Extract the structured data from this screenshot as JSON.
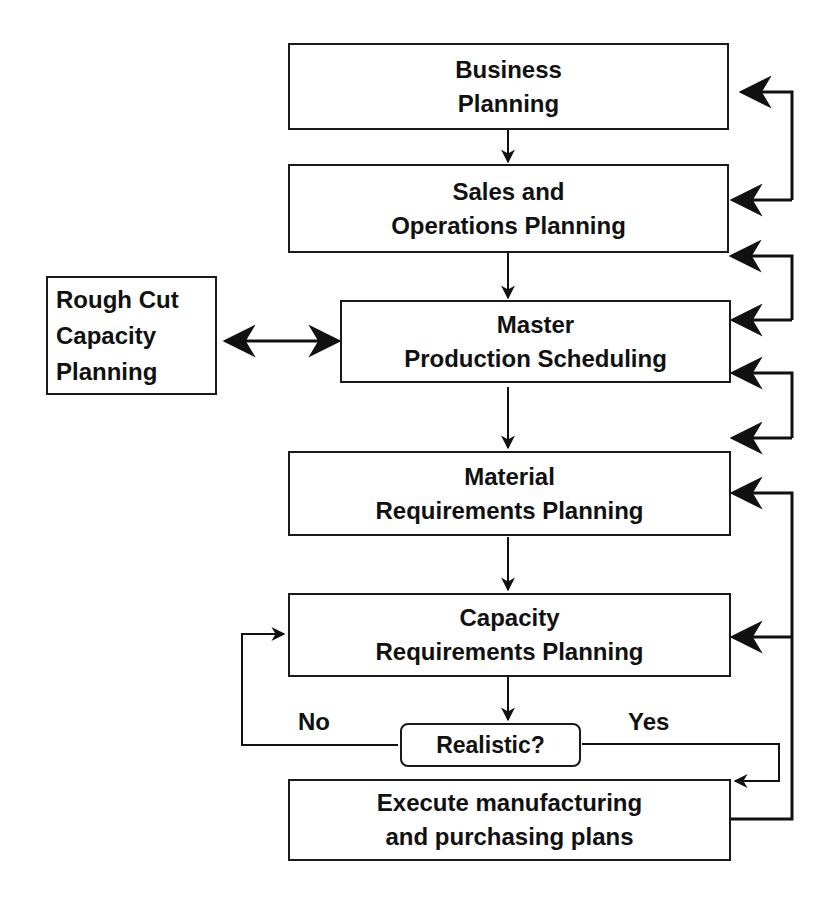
{
  "diagram": {
    "type": "flowchart",
    "nodes": {
      "business": {
        "line1": "Business",
        "line2": "Planning"
      },
      "sop": {
        "line1": "Sales and",
        "line2": "Operations Planning"
      },
      "mps": {
        "line1": "Master",
        "line2": "Production Scheduling"
      },
      "rccp": {
        "line1": "Rough Cut",
        "line2": "Capacity",
        "line3": "Planning"
      },
      "mrp": {
        "line1": "Material",
        "line2": "Requirements Planning"
      },
      "crp": {
        "line1": "Capacity",
        "line2": "Requirements Planning"
      },
      "decision": {
        "label": "Realistic?"
      },
      "execute": {
        "line1": "Execute manufacturing",
        "line2": "and purchasing plans"
      }
    },
    "edge_labels": {
      "no": "No",
      "yes": "Yes"
    },
    "edges": [
      {
        "from": "Business Planning",
        "to": "Sales and Operations Planning"
      },
      {
        "from": "Sales and Operations Planning",
        "to": "Business Planning",
        "kind": "feedback"
      },
      {
        "from": "Sales and Operations Planning",
        "to": "Master Production Scheduling"
      },
      {
        "from": "Master Production Scheduling",
        "to": "Sales and Operations Planning",
        "kind": "feedback"
      },
      {
        "from": "Rough Cut Capacity Planning",
        "to": "Master Production Scheduling",
        "kind": "bidirectional"
      },
      {
        "from": "Master Production Scheduling",
        "to": "Material Requirements Planning"
      },
      {
        "from": "Material Requirements Planning",
        "to": "Master Production Scheduling",
        "kind": "feedback"
      },
      {
        "from": "Material Requirements Planning",
        "to": "Capacity Requirements Planning"
      },
      {
        "from": "Capacity Requirements Planning",
        "to": "Realistic?"
      },
      {
        "from": "Realistic?",
        "to": "Capacity Requirements Planning",
        "label": "No"
      },
      {
        "from": "Realistic?",
        "to": "Execute manufacturing and purchasing plans",
        "label": "Yes"
      },
      {
        "from": "Execute manufacturing and purchasing plans",
        "to": "Material Requirements Planning",
        "kind": "feedback"
      },
      {
        "from": "Execute manufacturing and purchasing plans",
        "to": "Capacity Requirements Planning",
        "kind": "feedback"
      }
    ]
  }
}
